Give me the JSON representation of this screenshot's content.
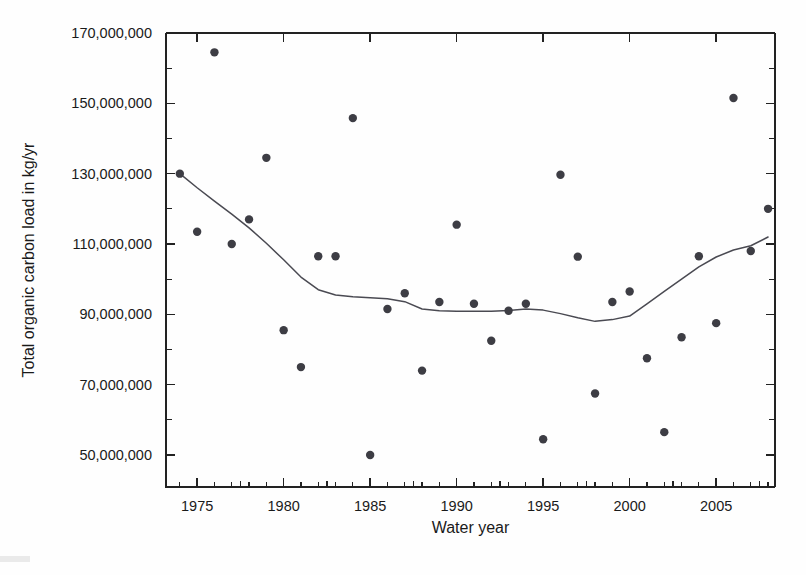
{
  "chart_data": {
    "type": "scatter",
    "title": "",
    "xlabel": "Water year",
    "ylabel": "Total organic carbon load in kg/yr",
    "xlim": [
      1973.2,
      2008.4
    ],
    "ylim": [
      42000000,
      170000000
    ],
    "grid": false,
    "legend": "none",
    "x_ticks": [
      1975,
      1980,
      1985,
      1990,
      1995,
      2000,
      2005
    ],
    "x_tick_labels": [
      "1975",
      "1980",
      "1985",
      "1990",
      "1995",
      "2000",
      "2005"
    ],
    "x_minor_ticks": [
      1974,
      1976,
      1977,
      1978,
      1979,
      1981,
      1982,
      1983,
      1984,
      1986,
      1987,
      1988,
      1989,
      1991,
      1992,
      1993,
      1994,
      1996,
      1997,
      1998,
      1999,
      2001,
      2002,
      2003,
      2004,
      2006,
      2007,
      2008
    ],
    "y_ticks": [
      50000000,
      70000000,
      90000000,
      110000000,
      130000000,
      150000000,
      170000000
    ],
    "y_tick_labels": [
      "50,000,000",
      "70,000,000",
      "90,000,000",
      "110,000,000",
      "130,000,000",
      "150,000,000",
      "170,000,000"
    ],
    "y_minor_ticks": [
      60000000,
      80000000,
      100000000,
      120000000,
      140000000,
      160000000
    ],
    "series": [
      {
        "name": "Annual total organic carbon load",
        "type": "scatter",
        "marker": "filled-circle",
        "color": "#3d3d44",
        "points": [
          {
            "x": 1974,
            "y": 130000000
          },
          {
            "x": 1975,
            "y": 113500000
          },
          {
            "x": 1976,
            "y": 164500000
          },
          {
            "x": 1977,
            "y": 110000000
          },
          {
            "x": 1978,
            "y": 117000000
          },
          {
            "x": 1979,
            "y": 134500000
          },
          {
            "x": 1980,
            "y": 85500000
          },
          {
            "x": 1981,
            "y": 75000000
          },
          {
            "x": 1982,
            "y": 106500000
          },
          {
            "x": 1983,
            "y": 106500000
          },
          {
            "x": 1984,
            "y": 145800000
          },
          {
            "x": 1985,
            "y": 50000000
          },
          {
            "x": 1986,
            "y": 91500000
          },
          {
            "x": 1987,
            "y": 96000000
          },
          {
            "x": 1988,
            "y": 74000000
          },
          {
            "x": 1989,
            "y": 93500000
          },
          {
            "x": 1990,
            "y": 115500000
          },
          {
            "x": 1991,
            "y": 93000000
          },
          {
            "x": 1992,
            "y": 82500000
          },
          {
            "x": 1993,
            "y": 91000000
          },
          {
            "x": 1994,
            "y": 93000000
          },
          {
            "x": 1995,
            "y": 54500000
          },
          {
            "x": 1996,
            "y": 129700000
          },
          {
            "x": 1997,
            "y": 106400000
          },
          {
            "x": 1998,
            "y": 67500000
          },
          {
            "x": 1999,
            "y": 93500000
          },
          {
            "x": 2000,
            "y": 96500000
          },
          {
            "x": 2001,
            "y": 77500000
          },
          {
            "x": 2002,
            "y": 56500000
          },
          {
            "x": 2003,
            "y": 83500000
          },
          {
            "x": 2004,
            "y": 106500000
          },
          {
            "x": 2005,
            "y": 87500000
          },
          {
            "x": 2006,
            "y": 151500000
          },
          {
            "x": 2007,
            "y": 108000000
          },
          {
            "x": 2008,
            "y": 120000000
          }
        ]
      },
      {
        "name": "Smoothed trend (LOWESS)",
        "type": "line",
        "color": "#4a4a52",
        "points": [
          {
            "x": 1974.0,
            "y": 130000000
          },
          {
            "x": 1975.0,
            "y": 126000000
          },
          {
            "x": 1976.0,
            "y": 122200000
          },
          {
            "x": 1977.0,
            "y": 118500000
          },
          {
            "x": 1978.0,
            "y": 114600000
          },
          {
            "x": 1979.0,
            "y": 110200000
          },
          {
            "x": 1980.0,
            "y": 105500000
          },
          {
            "x": 1981.0,
            "y": 100600000
          },
          {
            "x": 1982.0,
            "y": 97000000
          },
          {
            "x": 1983.0,
            "y": 95500000
          },
          {
            "x": 1984.0,
            "y": 95000000
          },
          {
            "x": 1985.0,
            "y": 94700000
          },
          {
            "x": 1986.0,
            "y": 94400000
          },
          {
            "x": 1987.0,
            "y": 93600000
          },
          {
            "x": 1988.0,
            "y": 91500000
          },
          {
            "x": 1989.0,
            "y": 91000000
          },
          {
            "x": 1990.0,
            "y": 90900000
          },
          {
            "x": 1991.0,
            "y": 90900000
          },
          {
            "x": 1992.0,
            "y": 90900000
          },
          {
            "x": 1993.0,
            "y": 91100000
          },
          {
            "x": 1994.0,
            "y": 91500000
          },
          {
            "x": 1995.0,
            "y": 91200000
          },
          {
            "x": 1996.0,
            "y": 90200000
          },
          {
            "x": 1997.0,
            "y": 89000000
          },
          {
            "x": 1998.0,
            "y": 88000000
          },
          {
            "x": 1999.0,
            "y": 88500000
          },
          {
            "x": 2000.0,
            "y": 89500000
          },
          {
            "x": 2001.0,
            "y": 93000000
          },
          {
            "x": 2002.0,
            "y": 96500000
          },
          {
            "x": 2003.0,
            "y": 100000000
          },
          {
            "x": 2004.0,
            "y": 103500000
          },
          {
            "x": 2005.0,
            "y": 106300000
          },
          {
            "x": 2006.0,
            "y": 108300000
          },
          {
            "x": 2007.0,
            "y": 109500000
          },
          {
            "x": 2008.0,
            "y": 112000000
          }
        ]
      }
    ]
  }
}
